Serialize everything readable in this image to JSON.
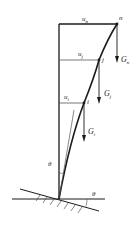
{
  "diagram": {
    "colors": {
      "line": "#1a1a1a",
      "thin": "#555555",
      "background": "#ffffff"
    },
    "displacements": [
      {
        "base": "u",
        "sub": "n"
      },
      {
        "base": "u",
        "sub": "j"
      },
      {
        "base": "u",
        "sub": "i"
      }
    ],
    "nodes": [
      {
        "label": "n"
      },
      {
        "label": "j"
      },
      {
        "label": "i"
      }
    ],
    "loads": [
      {
        "base": "G",
        "sub": "n"
      },
      {
        "base": "G",
        "sub": "j"
      },
      {
        "base": "G",
        "sub": "i"
      }
    ],
    "angles": {
      "tilt_label": "θ",
      "ground_label": "θ"
    }
  }
}
